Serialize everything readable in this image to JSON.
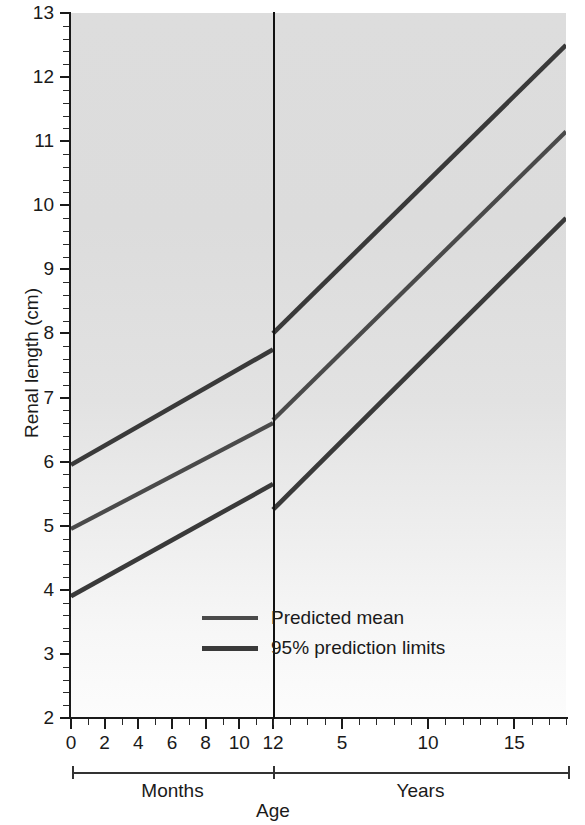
{
  "chart_data": {
    "type": "line",
    "title": "",
    "xlabel": "Age",
    "ylabel": "Renal length (cm)",
    "ylim": [
      2,
      13
    ],
    "ytick_labels": [
      "13",
      "12",
      "11",
      "10",
      "9",
      "8",
      "7",
      "6",
      "5",
      "4",
      "3",
      "2"
    ],
    "ytick_values": [
      13,
      12,
      11,
      10,
      9,
      8,
      7,
      6,
      5,
      4,
      3,
      2
    ],
    "y_minor_step": 0.2,
    "grid": false,
    "legend_position": "bottom-right",
    "panels": [
      {
        "name": "Months",
        "group_label": "Months",
        "x_unit": "months",
        "xlim": [
          0,
          12
        ],
        "xtick_labels": [
          "0",
          "2",
          "4",
          "6",
          "8",
          "10",
          "12"
        ],
        "xtick_values": [
          0,
          2,
          4,
          6,
          8,
          10,
          12
        ],
        "x_minor_step": 1
      },
      {
        "name": "Years",
        "group_label": "Years",
        "x_unit": "years",
        "xlim": [
          1,
          18
        ],
        "xtick_labels": [
          "5",
          "10",
          "15"
        ],
        "xtick_values": [
          5,
          10,
          15
        ],
        "x_minor_step": 1
      }
    ],
    "series": [
      {
        "name": "95% prediction limits",
        "role": "upper-limit",
        "color": "#3a3a3a",
        "segments": [
          {
            "panel": "Months",
            "points": [
              {
                "x": 0,
                "y": 5.95
              },
              {
                "x": 12,
                "y": 7.75
              }
            ]
          },
          {
            "panel": "Years",
            "points": [
              {
                "x": 1,
                "y": 8.0
              },
              {
                "x": 18,
                "y": 12.5
              }
            ]
          }
        ]
      },
      {
        "name": "Predicted mean",
        "role": "mean",
        "color": "#4a4a4a",
        "segments": [
          {
            "panel": "Months",
            "points": [
              {
                "x": 0,
                "y": 4.95
              },
              {
                "x": 12,
                "y": 6.6
              }
            ]
          },
          {
            "panel": "Years",
            "points": [
              {
                "x": 1,
                "y": 6.65
              },
              {
                "x": 18,
                "y": 11.15
              }
            ]
          }
        ]
      },
      {
        "name": "95% prediction limits",
        "role": "lower-limit",
        "color": "#3a3a3a",
        "segments": [
          {
            "panel": "Months",
            "points": [
              {
                "x": 0,
                "y": 3.9
              },
              {
                "x": 12,
                "y": 5.65
              }
            ]
          },
          {
            "panel": "Years",
            "points": [
              {
                "x": 1,
                "y": 5.25
              },
              {
                "x": 18,
                "y": 9.8
              }
            ]
          }
        ]
      }
    ],
    "legend": [
      {
        "label": "Predicted mean",
        "color": "#4a4a4a"
      },
      {
        "label": "95% prediction limits",
        "color": "#3a3a3a"
      }
    ],
    "annotations": {
      "divider_at": "12 months / 1 year boundary"
    }
  }
}
